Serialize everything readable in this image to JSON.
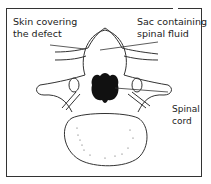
{
  "diagram": {
    "labels": {
      "skin": [
        "Skin covering",
        "the defect"
      ],
      "sac": [
        "Sac containing",
        "spinal fluid"
      ],
      "cord": [
        "Spinal",
        "cord"
      ]
    },
    "colors": {
      "line": "#333333",
      "cord_fill": "#111111",
      "background": "#ffffff"
    }
  }
}
